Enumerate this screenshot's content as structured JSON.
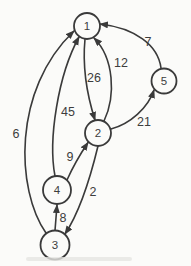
{
  "figure": {
    "type": "directed-weighted-graph",
    "background_color": "#fbfbf9",
    "ink_color": "#3a3a3a",
    "nodes": [
      {
        "id": "1",
        "label": "1"
      },
      {
        "id": "2",
        "label": "2"
      },
      {
        "id": "3",
        "label": "3"
      },
      {
        "id": "4",
        "label": "4"
      },
      {
        "id": "5",
        "label": "5"
      }
    ],
    "edges": [
      {
        "from": "3",
        "to": "1",
        "weight": "6"
      },
      {
        "from": "4",
        "to": "1",
        "weight": "45"
      },
      {
        "from": "1",
        "to": "2",
        "weight": "26"
      },
      {
        "from": "2",
        "to": "1",
        "weight": "12"
      },
      {
        "from": "5",
        "to": "1",
        "weight": "7"
      },
      {
        "from": "2",
        "to": "5",
        "weight": "21"
      },
      {
        "from": "4",
        "to": "2",
        "weight": "9"
      },
      {
        "from": "2",
        "to": "3",
        "weight": "2"
      },
      {
        "from": "3",
        "to": "4",
        "weight": "8"
      }
    ]
  }
}
